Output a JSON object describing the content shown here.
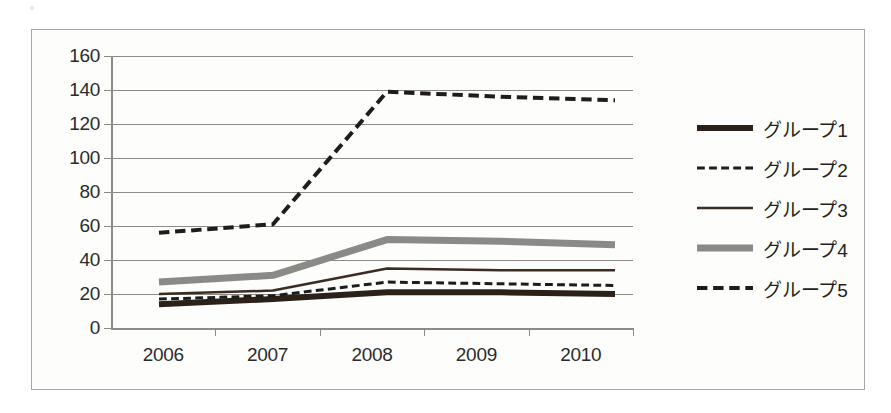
{
  "chart_data": {
    "type": "line",
    "title": "",
    "xlabel": "",
    "ylabel": "",
    "categories": [
      "2006",
      "2007",
      "2008",
      "2009",
      "2010"
    ],
    "x": [
      2006,
      2007,
      2008,
      2009,
      2010
    ],
    "ylim": [
      0,
      160
    ],
    "y_ticks": [
      0,
      20,
      40,
      60,
      80,
      100,
      120,
      140,
      160
    ],
    "grid": true,
    "legend_position": "right",
    "series": [
      {
        "name": "グループ1",
        "values": [
          14,
          17,
          21,
          21,
          20
        ],
        "style": "solid",
        "width": 6,
        "color": "#2b2119"
      },
      {
        "name": "グループ2",
        "values": [
          17,
          19,
          27,
          26,
          25
        ],
        "style": "dashed",
        "width": 3,
        "color": "#1c1c1c"
      },
      {
        "name": "グループ3",
        "values": [
          20,
          22,
          35,
          34,
          34
        ],
        "style": "solid",
        "width": 2.5,
        "color": "#3b2b22"
      },
      {
        "name": "グループ4",
        "values": [
          27,
          31,
          52,
          51,
          49
        ],
        "style": "solid",
        "width": 7,
        "color": "#8a8a86"
      },
      {
        "name": "グループ5",
        "values": [
          56,
          61,
          139,
          136,
          134
        ],
        "style": "dashed",
        "width": 4,
        "color": "#201c19"
      }
    ]
  },
  "legend": {
    "items": [
      {
        "label": "グループ1"
      },
      {
        "label": "グループ2"
      },
      {
        "label": "グループ3"
      },
      {
        "label": "グループ4"
      },
      {
        "label": "グループ5"
      }
    ]
  },
  "axes": {
    "y_tick_labels": [
      "160",
      "140",
      "120",
      "100",
      "80",
      "60",
      "40",
      "20",
      "0"
    ],
    "x_tick_labels": [
      "2006",
      "2007",
      "2008",
      "2009",
      "2010"
    ]
  },
  "colors": {
    "grid": "#8c8b86",
    "frame": "#a8a7a2",
    "text": "#2b2b2b",
    "background": "#fdfdfb",
    "series_gray": "#8a8a86",
    "series_dark": "#2b2119"
  }
}
